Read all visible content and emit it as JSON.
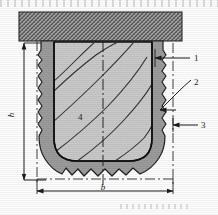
{
  "figure": {
    "type": "engineering-cross-section",
    "title": ""
  },
  "colors": {
    "ground_hatch": "#9a9a9a",
    "outer_ring": "#9c9c9c",
    "inner_core": "#c9c9c9",
    "outline": "#141414",
    "dimension_line": "#2a2a2a",
    "background": "#fefefe"
  },
  "callouts": [
    {
      "id": "1",
      "label": "1",
      "x": 196,
      "y": 61
    },
    {
      "id": "2",
      "label": "2",
      "x": 196,
      "y": 85
    },
    {
      "id": "3",
      "label": "3",
      "x": 203,
      "y": 128
    },
    {
      "id": "4",
      "label": "4",
      "x": 78,
      "y": 120
    }
  ],
  "dimensions": {
    "height": {
      "label": "h",
      "orientation": "vertical",
      "side": "left"
    },
    "width": {
      "label": "b",
      "orientation": "horizontal",
      "side": "bottom"
    }
  },
  "ground_layer": {
    "name": "ground-surface-hatch",
    "pattern": "cross-hatch"
  }
}
